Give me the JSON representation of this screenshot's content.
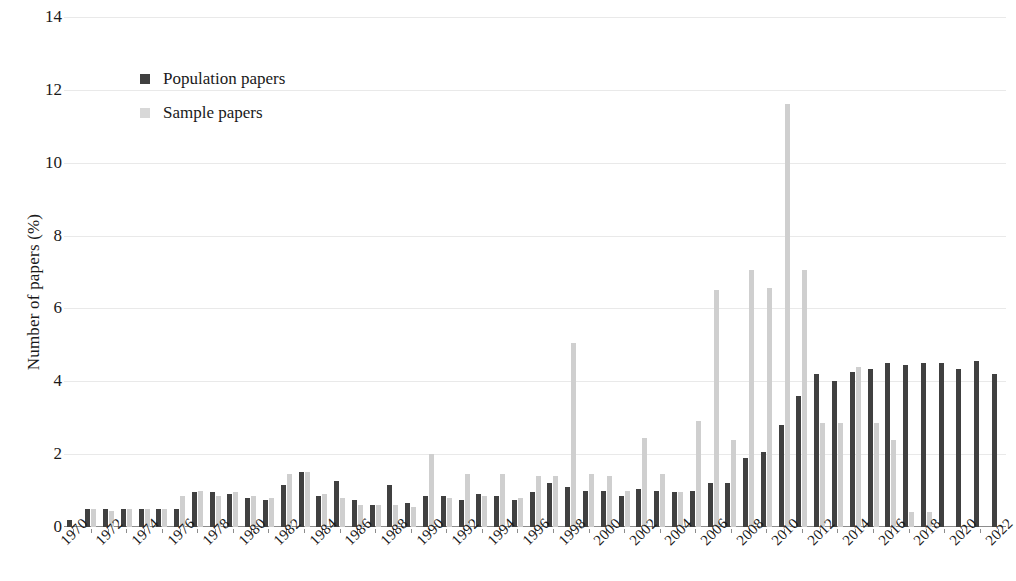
{
  "chart_data": {
    "type": "bar",
    "title": "",
    "xlabel": "",
    "ylabel": "Number of papers (%)",
    "ylim": [
      0,
      14
    ],
    "ytick_values": [
      0,
      2,
      4,
      6,
      8,
      10,
      12,
      14
    ],
    "ytick_labels": [
      "0",
      "2",
      "4",
      "6",
      "8",
      "10",
      "12",
      "14"
    ],
    "grid": true,
    "grid_axis": "y",
    "legend_position": "upper-left-inset",
    "categories": [
      "1970",
      "1971",
      "1972",
      "1973",
      "1974",
      "1975",
      "1976",
      "1977",
      "1978",
      "1979",
      "1980",
      "1981",
      "1982",
      "1983",
      "1984",
      "1985",
      "1986",
      "1987",
      "1988",
      "1989",
      "1990",
      "1991",
      "1992",
      "1993",
      "1994",
      "1995",
      "1996",
      "1997",
      "1998",
      "1999",
      "2000",
      "2001",
      "2002",
      "2003",
      "2004",
      "2005",
      "2006",
      "2007",
      "2008",
      "2009",
      "2010",
      "2011",
      "2012",
      "2013",
      "2014",
      "2015",
      "2016",
      "2017",
      "2018",
      "2019",
      "2020",
      "2021",
      "2022"
    ],
    "xtick_labels_shown": [
      "1970",
      "1972",
      "1974",
      "1976",
      "1978",
      "1980",
      "1982",
      "1984",
      "1986",
      "1988",
      "1990",
      "1992",
      "1994",
      "1996",
      "1998",
      "2000",
      "2002",
      "2004",
      "2006",
      "2008",
      "2010",
      "2012",
      "2014",
      "2016",
      "2018",
      "2020",
      "2022"
    ],
    "series": [
      {
        "name": "Population papers",
        "color": "#404040",
        "values": [
          0.2,
          0.5,
          0.5,
          0.5,
          0.5,
          0.5,
          0.5,
          0.95,
          0.95,
          0.9,
          0.8,
          0.75,
          1.15,
          1.5,
          0.85,
          1.25,
          0.75,
          0.6,
          1.15,
          0.65,
          0.85,
          0.85,
          0.75,
          0.9,
          0.85,
          0.75,
          0.95,
          1.2,
          1.1,
          1.0,
          1.0,
          0.85,
          1.05,
          1.0,
          0.95,
          1.0,
          1.2,
          1.2,
          1.9,
          2.05,
          2.8,
          3.6,
          4.2,
          4.0,
          4.25,
          4.35,
          4.5,
          4.45,
          4.5,
          4.5,
          4.35,
          4.55,
          4.2
        ]
      },
      {
        "name": "Sample papers",
        "color": "#cfcfcf",
        "values": [
          0.0,
          0.5,
          0.45,
          0.5,
          0.5,
          0.5,
          0.85,
          1.0,
          0.85,
          0.95,
          0.85,
          0.8,
          1.45,
          1.5,
          0.9,
          0.8,
          0.6,
          0.6,
          0.6,
          0.55,
          2.0,
          0.8,
          1.45,
          0.85,
          1.45,
          0.8,
          1.4,
          1.4,
          5.05,
          1.45,
          1.4,
          1.0,
          2.45,
          1.45,
          0.95,
          2.9,
          6.5,
          2.4,
          7.05,
          6.55,
          11.6,
          7.05,
          2.85,
          2.85,
          4.4,
          2.85,
          2.4,
          0.4,
          0.4,
          0.0,
          0.0,
          0.0,
          0.0
        ]
      }
    ],
    "legend": [
      {
        "label": "Population papers",
        "swatch": "dark-square"
      },
      {
        "label": "Sample papers",
        "swatch": "light-square"
      }
    ],
    "colors": {
      "population": "#404040",
      "sample": "#cfcfcf",
      "gridline": "#e9e9e9",
      "axis": "#8c8c8c",
      "text": "#1a1a1a",
      "background": "#ffffff"
    }
  }
}
